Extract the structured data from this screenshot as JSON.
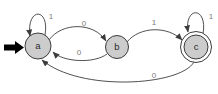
{
  "diagram": {
    "type": "finite-state-automaton",
    "background": "#ffffff",
    "colors": {
      "state_fill": "#cccccc",
      "accepting_ring_fill": "#ffffff",
      "state_stroke": "#3c3c3c",
      "edge_stroke": "#3c3c3c",
      "edge_label": "#7a7a7a",
      "state_label": "#2b2b2b",
      "initial_arrow": "#000000"
    },
    "states": [
      {
        "id": "a",
        "label": "a",
        "x": 38,
        "y": 46,
        "r": 13,
        "outer_r": null,
        "initial": true,
        "accepting": false
      },
      {
        "id": "b",
        "label": "b",
        "x": 117,
        "y": 47,
        "r": 11.5,
        "outer_r": null,
        "initial": false,
        "accepting": false
      },
      {
        "id": "c",
        "label": "c",
        "x": 196,
        "y": 47,
        "r": 12,
        "outer_r": 15.5,
        "initial": false,
        "accepting": true
      }
    ],
    "initial_arrow": {
      "target": "a",
      "points": "4,44.5 15,44.5 15,41 24,47.5 15,54 15,50.5 4,50.5"
    },
    "transitions": [
      {
        "from": "a",
        "to": "a",
        "label": "1",
        "path": "M 45,35 C 50,7 26,7 30,36",
        "label_x": 51,
        "label_y": 19
      },
      {
        "from": "a",
        "to": "b",
        "label": "0",
        "path": "M 49,40 C 62,22 94,22 106,41",
        "label_x": 84,
        "label_y": 26
      },
      {
        "from": "b",
        "to": "a",
        "label": "0",
        "path": "M 107,54 C 94,64 63,62 53,52",
        "label_x": 79,
        "label_y": 55
      },
      {
        "from": "b",
        "to": "c",
        "label": "1",
        "path": "M 127,42 C 140,26 168,26 182,40",
        "label_x": 154,
        "label_y": 25
      },
      {
        "from": "c",
        "to": "c",
        "label": "1",
        "path": "M 203,34 C 208,6 184,6 188,32",
        "label_x": 211,
        "label_y": 19
      },
      {
        "from": "c",
        "to": "a",
        "label": "0",
        "path": "M 194,62 C 180,86 80,92 42,60",
        "label_x": 154,
        "label_y": 78
      }
    ]
  }
}
